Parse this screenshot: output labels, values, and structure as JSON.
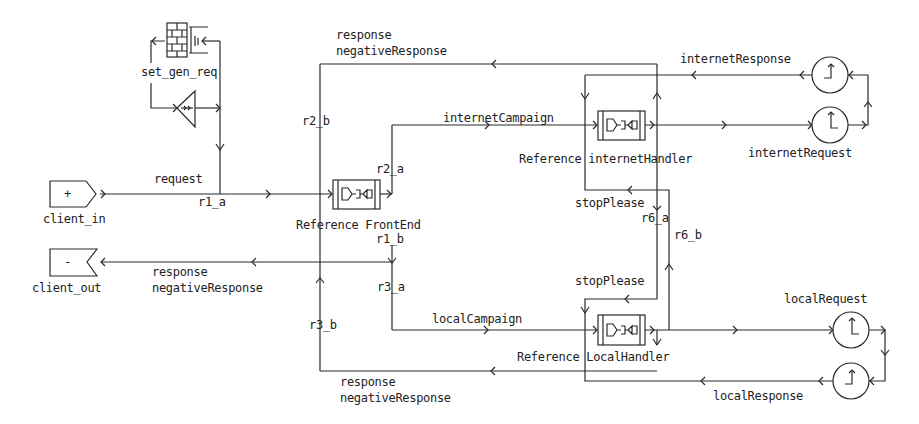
{
  "diagram": {
    "type": "structure-diagram",
    "colors": {
      "line": "#2a2a2a",
      "background": "#ffffff",
      "text": "#222222"
    },
    "ports": {
      "client_in": {
        "label": "client_in",
        "symbol": "+"
      },
      "client_out": {
        "label": "client_out",
        "symbol": "-"
      }
    },
    "set_gen_req": {
      "label": "set_gen_req",
      "icon": "brick-wall-icon"
    },
    "actors": {
      "frontend": {
        "label": "Reference FrontEnd"
      },
      "internetHandler": {
        "label": "Reference internetHandler"
      },
      "localHandler": {
        "label": "Reference LocalHandler"
      }
    },
    "timers": {
      "internetResponse": {
        "label": "internetResponse"
      },
      "internetRequest": {
        "label": "internetRequest"
      },
      "localRequest": {
        "label": "localRequest"
      },
      "localResponse": {
        "label": "localResponse"
      }
    },
    "bindings": {
      "r1_a": "r1_a",
      "r1_b": "r1_b",
      "r2_a": "r2_a",
      "r2_b": "r2_b",
      "r3_a": "r3_a",
      "r3_b": "r3_b",
      "r6_a": "r6_a",
      "r6_b": "r6_b"
    },
    "signals": {
      "request": "request",
      "top_response": "response",
      "top_negative": "negativeResponse",
      "internetCampaign": "internetCampaign",
      "stopPlease_top": "stopPlease",
      "stopPlease_bottom": "stopPlease",
      "client_response": "response",
      "client_negative": "negativeResponse",
      "localCampaign": "localCampaign",
      "bottom_response": "response",
      "bottom_negative": "negativeResponse"
    }
  }
}
